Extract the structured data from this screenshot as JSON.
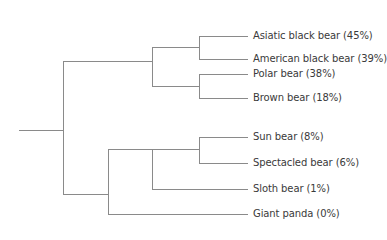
{
  "diagram": {
    "type": "phylogenetic-tree",
    "line_color": "#8a8a8a",
    "text_color": "#3a3a3a",
    "leaves": [
      {
        "id": "asiatic",
        "label": "Asiatic black bear (45%)",
        "y": 36
      },
      {
        "id": "american",
        "label": "American black bear (39%)",
        "y": 59
      },
      {
        "id": "polar",
        "label": "Polar bear (38%)",
        "y": 74
      },
      {
        "id": "brown",
        "label": "Brown bear (18%)",
        "y": 98
      },
      {
        "id": "sun",
        "label": "Sun bear (8%)",
        "y": 137
      },
      {
        "id": "spectacled",
        "label": "Spectacled bear (6%)",
        "y": 163
      },
      {
        "id": "sloth",
        "label": "Sloth bear (1%)",
        "y": 189
      },
      {
        "id": "panda",
        "label": "Giant panda (0%)",
        "y": 214
      }
    ]
  }
}
